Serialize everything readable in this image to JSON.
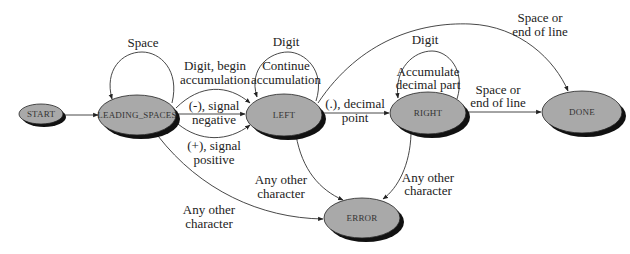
{
  "diagram": {
    "type": "state-machine",
    "nodes": [
      {
        "id": "start",
        "label": "START"
      },
      {
        "id": "leading_spaces",
        "label": "LEADING_SPACES"
      },
      {
        "id": "left",
        "label": "LEFT"
      },
      {
        "id": "right",
        "label": "RIGHT"
      },
      {
        "id": "done",
        "label": "DONE"
      },
      {
        "id": "error",
        "label": "ERROR"
      }
    ],
    "edges": [
      {
        "from": "start",
        "to": "leading_spaces",
        "label": ""
      },
      {
        "from": "leading_spaces",
        "to": "leading_spaces",
        "label": "Space"
      },
      {
        "from": "leading_spaces",
        "to": "left",
        "label_line1": "Digit, begin",
        "label_line2": "accumulation"
      },
      {
        "from": "leading_spaces",
        "to": "left",
        "label_line1": "(-), signal",
        "label_line2": "negative"
      },
      {
        "from": "leading_spaces",
        "to": "left",
        "label_line1": "(+), signal",
        "label_line2": "positive"
      },
      {
        "from": "leading_spaces",
        "to": "error",
        "label_line1": "Any other",
        "label_line2": "character"
      },
      {
        "from": "left",
        "to": "left",
        "label": "Digit",
        "label_line1": "Continue",
        "label_line2": "accumulation"
      },
      {
        "from": "left",
        "to": "right",
        "label_line1": "(.), decimal",
        "label_line2": "point"
      },
      {
        "from": "left",
        "to": "done",
        "label_line1": "Space or",
        "label_line2": "end of line"
      },
      {
        "from": "left",
        "to": "error",
        "label_line1": "Any other",
        "label_line2": "character"
      },
      {
        "from": "right",
        "to": "right",
        "label": "Digit",
        "label_line1": "Accumulate",
        "label_line2": "decimal part"
      },
      {
        "from": "right",
        "to": "done",
        "label_line1": "Space or",
        "label_line2": "end of line"
      },
      {
        "from": "right",
        "to": "error",
        "label_line1": "Any other",
        "label_line2": "character"
      }
    ]
  }
}
